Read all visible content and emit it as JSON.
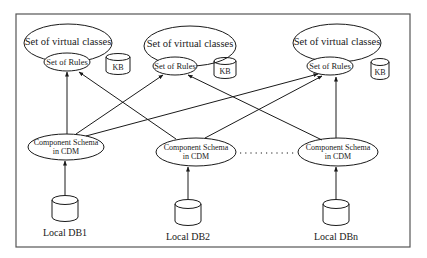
{
  "diagram": {
    "type": "architecture",
    "border": {
      "x": 16,
      "y": 14,
      "w": 394,
      "h": 233,
      "color": "#555555"
    },
    "upper_groups": [
      {
        "id": "g1",
        "virtual_classes": {
          "label": "Set of virtual classes",
          "cx": 68,
          "cy": 43,
          "rx": 44,
          "ry": 19
        },
        "rules": {
          "label": "Set of Rules",
          "cx": 67,
          "cy": 62,
          "rx": 23,
          "ry": 9
        },
        "kb": {
          "label": "KB",
          "x": 106,
          "y": 54,
          "w": 24,
          "h": 20
        }
      },
      {
        "id": "g2",
        "virtual_classes": {
          "label": "Set of virtual classes",
          "cx": 190,
          "cy": 46,
          "rx": 46,
          "ry": 20
        },
        "rules": {
          "label": "Set of Rules",
          "cx": 175,
          "cy": 66,
          "rx": 22,
          "ry": 9
        },
        "kb": {
          "label": "KB",
          "x": 214,
          "y": 58,
          "w": 22,
          "h": 20
        }
      },
      {
        "id": "g3",
        "virtual_classes": {
          "label": "Set of virtual classes",
          "cx": 337,
          "cy": 43,
          "rx": 44,
          "ry": 19
        },
        "rules": {
          "label": "Set of Rules",
          "cx": 330,
          "cy": 66,
          "rx": 23,
          "ry": 9
        },
        "kb": {
          "label": "KB",
          "x": 371,
          "y": 59,
          "w": 18,
          "h": 20
        }
      }
    ],
    "component_schemas": [
      {
        "id": "cs1",
        "line1": "Component Schema",
        "line2": "in CDM",
        "cx": 66,
        "cy": 147,
        "rx": 38,
        "ry": 13
      },
      {
        "id": "cs2",
        "line1": "Component Schema",
        "line2": "in CDM",
        "cx": 196,
        "cy": 152,
        "rx": 40,
        "ry": 14
      },
      {
        "id": "csn",
        "line1": "Component Schema",
        "line2": "in CDM",
        "cx": 338,
        "cy": 152,
        "rx": 40,
        "ry": 14
      }
    ],
    "ellipsis": "· · · · · · · · · · ·",
    "local_dbs": [
      {
        "id": "db1",
        "label": "Local DB1",
        "cx": 65,
        "top": 196,
        "w": 26,
        "h": 24,
        "label_y": 232
      },
      {
        "id": "db2",
        "label": "Local DB2",
        "cx": 188,
        "top": 200,
        "w": 26,
        "h": 24,
        "label_y": 236
      },
      {
        "id": "dbn",
        "label": "Local DBn",
        "cx": 336,
        "top": 200,
        "w": 26,
        "h": 24,
        "label_y": 236
      }
    ],
    "edges": [
      {
        "from": "cs1",
        "to": "g1.rules"
      },
      {
        "from": "cs1",
        "to": "g2.rules"
      },
      {
        "from": "cs1",
        "to": "g3.rules"
      },
      {
        "from": "cs2",
        "to": "g1.rules"
      },
      {
        "from": "cs2",
        "to": "g3.rules"
      },
      {
        "from": "csn",
        "to": "g2.rules"
      },
      {
        "from": "csn",
        "to": "g3.rules"
      },
      {
        "from": "db1",
        "to": "cs1"
      },
      {
        "from": "db2",
        "to": "cs2"
      },
      {
        "from": "dbn",
        "to": "csn"
      }
    ]
  },
  "labels": {
    "g1_vc": "Set of virtual classes",
    "g1_rules": "Set of Rules",
    "g1_kb": "KB",
    "g2_vc": "Set of virtual classes",
    "g2_rules": "Set of Rules",
    "g2_kb": "KB",
    "g3_vc": "Set of virtual classes",
    "g3_rules": "Set of Rules",
    "g3_kb": "KB",
    "cs1_l1": "Component Schema",
    "cs1_l2": "in CDM",
    "cs2_l1": "Component Schema",
    "cs2_l2": "in CDM",
    "csn_l1": "Component Schema",
    "csn_l2": "in CDM",
    "db1": "Local DB1",
    "db2": "Local DB2",
    "dbn": "Local DBn"
  }
}
